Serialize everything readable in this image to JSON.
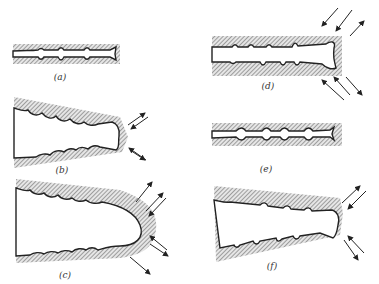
{
  "figure": {
    "panels": [
      {
        "id": "a",
        "label": "(a)",
        "description": "narrow crack with wavy faces in hatched solid"
      },
      {
        "id": "b",
        "label": "(b)",
        "description": "crack opening, tip with outward/inward arrows"
      },
      {
        "id": "c",
        "label": "(c)",
        "description": "wide U-shaped opening with blunted rounded tip and arrows"
      },
      {
        "id": "d",
        "label": "(d)",
        "description": "crack in block with compressive arrows at tip"
      },
      {
        "id": "e",
        "label": "(e)",
        "description": "re-closed crack with wavy faces"
      },
      {
        "id": "f",
        "label": "(f)",
        "description": "crack reopening with arrows at tip"
      }
    ],
    "colors": {
      "ink": "#222222",
      "background": "#ffffff"
    }
  }
}
